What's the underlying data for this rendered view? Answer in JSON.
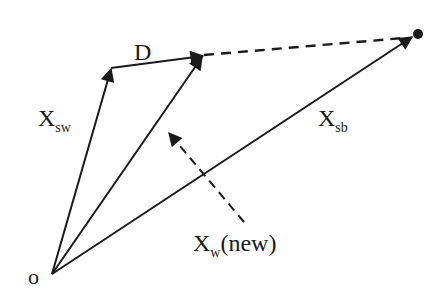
{
  "diagram": {
    "type": "vector-diagram",
    "colors": {
      "stroke": "#1a1a1a",
      "background": "#ffffff"
    },
    "labels": {
      "origin": "o",
      "d": "D",
      "x_sw_main": "X",
      "x_sw_sub": "sw",
      "x_sb_main": "X",
      "x_sb_sub": "sb",
      "x_w_main": "X",
      "x_w_sub": "w",
      "x_w_suffix": "(new)"
    },
    "vectors": [
      {
        "name": "X_sw",
        "from": "o",
        "to": "tip of X_sw",
        "style": "solid"
      },
      {
        "name": "D",
        "from": "tip of X_sw",
        "to": "tip of X_w(new)",
        "style": "solid"
      },
      {
        "name": "X_w(new)",
        "from": "o",
        "to": "tip of D",
        "style": "solid"
      },
      {
        "name": "X_sb",
        "from": "o",
        "to": "target point",
        "style": "solid"
      },
      {
        "name": "extension",
        "from": "tip of X_w(new)",
        "to": "target point",
        "style": "dashed"
      },
      {
        "name": "X_w(new) pointer",
        "from": "label X_w(new)",
        "to": "X_w(new) vector",
        "style": "dashed"
      }
    ]
  }
}
